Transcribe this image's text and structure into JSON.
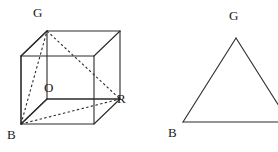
{
  "figure": {
    "type": "geometry-diagram",
    "stroke_color": "#2b2b2b",
    "dashed_color": "#2b2b2b",
    "background_color": "#ffffff",
    "solid_stroke_width": 1.1,
    "dashed_stroke_width": 1.1,
    "dash_pattern": "2.4 2.4"
  },
  "left_figure": {
    "name": "cube-with-diagonals",
    "labels": {
      "g": "G",
      "o": "O",
      "r": "R",
      "b": "B"
    },
    "label_positions": {
      "g": {
        "x": 33,
        "y": 6
      },
      "o": {
        "x": 44,
        "y": 81
      },
      "r": {
        "x": 117,
        "y": 92
      },
      "b": {
        "x": 7,
        "y": 128
      }
    },
    "vertices": {
      "front_bottom_left": {
        "x": 21,
        "y": 124
      },
      "front_bottom_right": {
        "x": 94,
        "y": 124
      },
      "front_top_left": {
        "x": 21,
        "y": 56
      },
      "front_top_right": {
        "x": 94,
        "y": 56
      },
      "back_bottom_left": {
        "x": 47,
        "y": 99
      },
      "back_bottom_right": {
        "x": 120,
        "y": 99
      },
      "back_top_left": {
        "x": 47,
        "y": 31
      },
      "back_top_right": {
        "x": 120,
        "y": 31
      }
    },
    "named_points": {
      "B": "front_bottom_left",
      "G": "back_top_left",
      "R": "back_bottom_right",
      "O": "front_top_left_interior"
    },
    "solid_edges": [
      "front-face-square",
      "top-left-receding-edge",
      "top-right-receding-edge",
      "bottom-right-receding-edge",
      "back-top-edge",
      "back-left-vertical-edge",
      "back-right-vertical-edge",
      "back-bottom-right-partial"
    ],
    "dashed_edges": [
      "B-to-G-diagonal",
      "G-to-R-diagonal",
      "B-to-R-diagonal",
      "hidden-back-bottom-edge",
      "hidden-back-left-vertical"
    ]
  },
  "right_figure": {
    "name": "triangle-bgr",
    "labels": {
      "g": "G",
      "b": "B"
    },
    "label_positions": {
      "g": {
        "x": 229,
        "y": 9
      },
      "b": {
        "x": 168,
        "y": 126
      }
    },
    "vertices": {
      "apex_g": {
        "x": 236,
        "y": 38
      },
      "left_b": {
        "x": 183,
        "y": 122
      },
      "right_r": {
        "x": 289,
        "y": 122
      }
    },
    "note": "right vertex R extends past the right edge of the image and is cropped"
  }
}
